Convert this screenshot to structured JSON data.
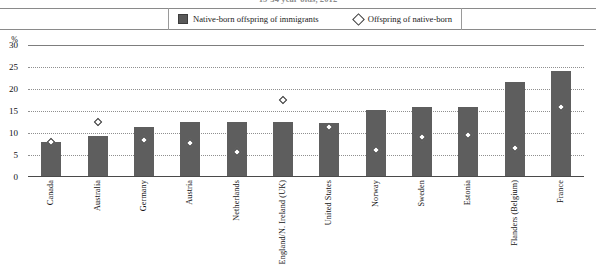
{
  "chart_data": {
    "type": "bar",
    "title": "15-34 year-olds, 2012",
    "xlabel": "",
    "ylabel": "%",
    "ylim": [
      0,
      30
    ],
    "yticks": [
      0,
      5,
      10,
      15,
      20,
      25,
      30
    ],
    "grid": true,
    "legend_position": "top",
    "categories": [
      "Canada",
      "Australia",
      "Germany",
      "Austria",
      "Netherlands",
      "England/N. Ireland (UK)",
      "United States",
      "Norway",
      "Sweden",
      "Estonia",
      "Flanders (Belgium)",
      "France"
    ],
    "series": [
      {
        "name": "Native-born offspring of immigrants",
        "marker": "bar",
        "color": "#5e5e5e",
        "values": [
          8.0,
          9.3,
          11.4,
          12.5,
          12.4,
          12.5,
          12.3,
          15.2,
          16.0,
          16.0,
          21.5,
          24.0
        ]
      },
      {
        "name": "Offspring of native-born",
        "marker": "diamond",
        "color": "#ffffff",
        "values": [
          8.0,
          12.5,
          8.4,
          7.7,
          5.7,
          17.5,
          11.4,
          6.1,
          9.2,
          9.5,
          6.5,
          15.8
        ]
      }
    ]
  },
  "legend": {
    "items": [
      {
        "label": "Native-born offspring of immigrants",
        "marker": "square"
      },
      {
        "label": "Offspring of native-born",
        "marker": "diamond"
      }
    ]
  },
  "axis": {
    "unit_label": "%",
    "ticks": [
      "30",
      "25",
      "20",
      "15",
      "10",
      "5",
      "0"
    ]
  }
}
